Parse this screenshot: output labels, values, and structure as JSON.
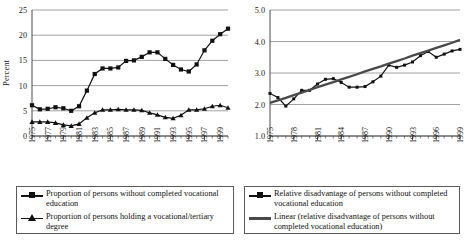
{
  "chart_data": [
    {
      "id": "left",
      "type": "line",
      "title": "",
      "xlabel": "",
      "ylabel": "Percent",
      "ylim": [
        0,
        25
      ],
      "yticks": [
        0,
        5,
        10,
        15,
        20,
        25
      ],
      "ytick_labels": [
        "0",
        "5",
        "10",
        "15",
        "20",
        "25"
      ],
      "grid": true,
      "legend_position": "below",
      "x": [
        1975,
        1976,
        1977,
        1978,
        1979,
        1980,
        1981,
        1982,
        1983,
        1984,
        1985,
        1986,
        1987,
        1988,
        1989,
        1990,
        1991,
        1992,
        1993,
        1994,
        1995,
        1996,
        1997,
        1998,
        1999,
        2000
      ],
      "xtick_labels": [
        "1975",
        "1977",
        "1979",
        "1981",
        "1983",
        "1985",
        "1987",
        "1989",
        "1991",
        "1993",
        "1995",
        "1997",
        "1999"
      ],
      "xtick_values": [
        1975,
        1977,
        1979,
        1981,
        1983,
        1985,
        1987,
        1989,
        1991,
        1993,
        1995,
        1997,
        1999
      ],
      "series": [
        {
          "name": "Proportion of persons without completed vocational education",
          "marker": "square",
          "values": [
            6.1,
            5.3,
            5.4,
            5.7,
            5.5,
            5.0,
            5.9,
            9.0,
            12.3,
            13.4,
            13.4,
            13.6,
            14.9,
            15.0,
            15.7,
            16.6,
            16.6,
            15.3,
            14.1,
            13.2,
            12.8,
            14.2,
            17.0,
            18.9,
            20.2,
            21.3
          ]
        },
        {
          "name": "Proportion of persons holding a vocational/tertiary degree",
          "marker": "triangle",
          "values": [
            2.8,
            2.8,
            2.8,
            2.6,
            2.2,
            2.0,
            2.4,
            3.6,
            4.6,
            5.2,
            5.2,
            5.3,
            5.2,
            5.2,
            5.1,
            4.6,
            4.2,
            3.7,
            3.5,
            4.1,
            5.2,
            5.2,
            5.4,
            5.9,
            6.1,
            5.6
          ]
        }
      ],
      "extra_points": {
        "note": "left series continue to 1999-2000 peak 24.2 then decline to 19.5"
      }
    },
    {
      "id": "right",
      "type": "line",
      "title": "",
      "xlabel": "",
      "ylabel": "",
      "ylim": [
        1.0,
        5.0
      ],
      "yticks": [
        1.0,
        2.0,
        3.0,
        4.0,
        5.0
      ],
      "ytick_labels": [
        "1.0",
        "2.0",
        "3.0",
        "4.0",
        "5.0"
      ],
      "grid": true,
      "legend_position": "below",
      "x": [
        1975,
        1976,
        1977,
        1978,
        1979,
        1980,
        1981,
        1982,
        1983,
        1984,
        1985,
        1986,
        1987,
        1988,
        1989,
        1990,
        1991,
        1992,
        1993,
        1994,
        1995,
        1996,
        1997,
        1998,
        1999
      ],
      "xtick_labels": [
        "1975",
        "1978",
        "1981",
        "1984",
        "1987",
        "1990",
        "1993",
        "1996",
        "1999"
      ],
      "xtick_values": [
        1975,
        1978,
        1981,
        1984,
        1987,
        1990,
        1993,
        1996,
        1999
      ],
      "series": [
        {
          "name": "Relative disadvantage of persons without completed vocational education",
          "marker": "small-square",
          "values": [
            2.35,
            2.22,
            1.95,
            2.18,
            2.45,
            2.45,
            2.65,
            2.8,
            2.82,
            2.7,
            2.55,
            2.55,
            2.57,
            2.72,
            2.9,
            3.25,
            3.18,
            3.25,
            3.35,
            3.55,
            3.68,
            3.5,
            3.6,
            3.7,
            3.75
          ]
        },
        {
          "name": "Linear (relative disadvantage of persons without completed vocational education)",
          "marker": "none",
          "trend": true,
          "values": [
            2.05,
            2.13,
            2.21,
            2.3,
            2.38,
            2.46,
            2.55,
            2.63,
            2.71,
            2.8,
            2.88,
            2.96,
            3.05,
            3.13,
            3.21,
            3.3,
            3.38,
            3.46,
            3.55,
            3.63,
            3.71,
            3.8,
            3.88,
            3.96,
            4.05
          ]
        }
      ]
    }
  ],
  "left_chart": {
    "y_axis_title": "Percent"
  },
  "legend_left": {
    "entries": [
      {
        "label": "Proportion of persons without completed vocational education",
        "marker": "square-line"
      },
      {
        "label": "Proportion of persons holding a vocational/tertiary degree",
        "marker": "triangle-line"
      }
    ]
  },
  "legend_right": {
    "entries": [
      {
        "label": "Relative disadvantage of persons without completed vocational education",
        "marker": "square-line"
      },
      {
        "label": "Linear (relative disadvantage of persons without completed vocational education)",
        "marker": "thick-line"
      }
    ]
  },
  "colors": {
    "series": "#111111",
    "trend": "#4a4a4a",
    "grid": "#8a8a8a",
    "axis": "#4a4a4a"
  }
}
